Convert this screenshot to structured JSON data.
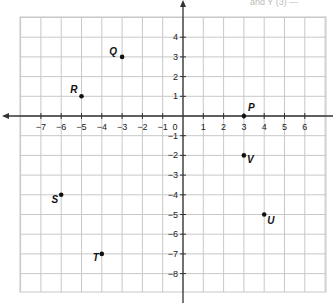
{
  "header": {
    "text": "and Y (3) —"
  },
  "chart_data": {
    "type": "scatter",
    "title": "",
    "xlabel": "",
    "ylabel": "",
    "xlim": [
      -8,
      7
    ],
    "ylim": [
      -9,
      5
    ],
    "grid": true,
    "x_ticks": [
      -7,
      -6,
      -5,
      -4,
      -3,
      -2,
      -1,
      0,
      1,
      2,
      3,
      4,
      5,
      6
    ],
    "y_ticks": [
      4,
      3,
      2,
      1,
      -1,
      -2,
      -3,
      -4,
      -5,
      -6,
      -7,
      -8
    ],
    "points": [
      {
        "label": "P",
        "x": 3,
        "y": 0
      },
      {
        "label": "Q",
        "x": -3,
        "y": 3
      },
      {
        "label": "R",
        "x": -5,
        "y": 1
      },
      {
        "label": "S",
        "x": -6,
        "y": -4
      },
      {
        "label": "T",
        "x": -4,
        "y": -7
      },
      {
        "label": "U",
        "x": 4,
        "y": -5
      },
      {
        "label": "V",
        "x": 3,
        "y": -2
      }
    ]
  },
  "layout": {
    "origin_x": 183,
    "origin_y": 116,
    "unit_x": 20.3,
    "unit_y": 19.7,
    "grid_left": 20,
    "grid_right": 326,
    "grid_top": 17,
    "grid_bottom": 292,
    "grid_color": "#c8c8c8",
    "axis_color": "#333333"
  }
}
